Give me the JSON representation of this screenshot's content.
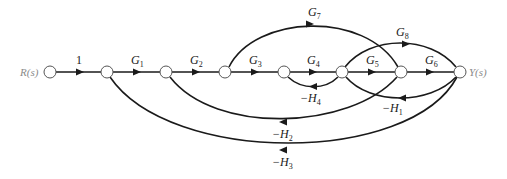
{
  "diagram": {
    "type": "signal-flow-graph",
    "input_label": "R(s)",
    "output_label": "Y(s)",
    "nodes": [
      {
        "id": "R",
        "x": 50
      },
      {
        "id": "n2",
        "x": 107
      },
      {
        "id": "n3",
        "x": 166
      },
      {
        "id": "n4",
        "x": 225
      },
      {
        "id": "n5",
        "x": 284
      },
      {
        "id": "n6",
        "x": 342
      },
      {
        "id": "n7",
        "x": 401
      },
      {
        "id": "Y",
        "x": 460
      }
    ],
    "forward_labels": {
      "e1": "1",
      "g1": "G",
      "g1_sub": "1",
      "g2": "G",
      "g2_sub": "2",
      "g3": "G",
      "g3_sub": "3",
      "g4": "G",
      "g4_sub": "4",
      "g5": "G",
      "g5_sub": "5",
      "g6": "G",
      "g6_sub": "6",
      "g7": "G",
      "g7_sub": "7",
      "g8": "G",
      "g8_sub": "8"
    },
    "feedback_labels": {
      "h1": "−H",
      "h1_sub": "1",
      "h2": "−H",
      "h2_sub": "2",
      "h3": "−H",
      "h3_sub": "3",
      "h4": "−H",
      "h4_sub": "4"
    },
    "edges": [
      {
        "from": "R",
        "to": "n2",
        "gain": "1"
      },
      {
        "from": "n2",
        "to": "n3",
        "gain": "G1"
      },
      {
        "from": "n3",
        "to": "n4",
        "gain": "G2"
      },
      {
        "from": "n4",
        "to": "n5",
        "gain": "G3"
      },
      {
        "from": "n5",
        "to": "n6",
        "gain": "G4"
      },
      {
        "from": "n6",
        "to": "n7",
        "gain": "G5"
      },
      {
        "from": "n7",
        "to": "Y",
        "gain": "G6"
      },
      {
        "from": "n4",
        "to": "n7",
        "gain": "G7"
      },
      {
        "from": "n6",
        "to": "Y",
        "gain": "G8"
      },
      {
        "from": "Y",
        "to": "n6",
        "gain": "-H1"
      },
      {
        "from": "n7",
        "to": "n3",
        "gain": "-H2"
      },
      {
        "from": "Y",
        "to": "n2",
        "gain": "-H3"
      },
      {
        "from": "n6",
        "to": "n5",
        "gain": "-H4"
      }
    ]
  }
}
